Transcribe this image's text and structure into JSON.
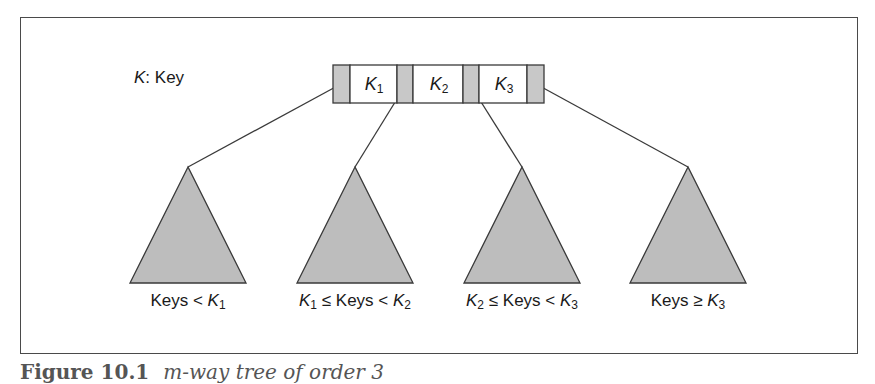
{
  "legend": {
    "symbol": "K",
    "text": ": Key"
  },
  "node": {
    "keys": [
      {
        "symbol": "K",
        "sub": "1"
      },
      {
        "symbol": "K",
        "sub": "2"
      },
      {
        "symbol": "K",
        "sub": "3"
      }
    ],
    "pointer_count": 4,
    "pointer_fill": "#c8c8c8",
    "key_fill": "#ffffff"
  },
  "subtrees": [
    {
      "label_parts": [
        "Keys < ",
        "K",
        "1"
      ],
      "label": "Keys < K1"
    },
    {
      "label_parts": [
        "K",
        "1",
        " ≤ Keys < ",
        "K",
        "2"
      ],
      "label": "K1 ≤ Keys < K2"
    },
    {
      "label_parts": [
        "K",
        "2",
        " ≤ Keys < ",
        "K",
        "3"
      ],
      "label": "K2 ≤ Keys < K3"
    },
    {
      "label_parts": [
        "Keys ≥ ",
        "K",
        "3"
      ],
      "label": "Keys ≥ K3"
    }
  ],
  "colors": {
    "triangle_fill": "#bdbdbd",
    "stroke": "#3a3a3a"
  },
  "caption": {
    "number": "Figure 10.1",
    "text": "m-way tree of order 3"
  }
}
